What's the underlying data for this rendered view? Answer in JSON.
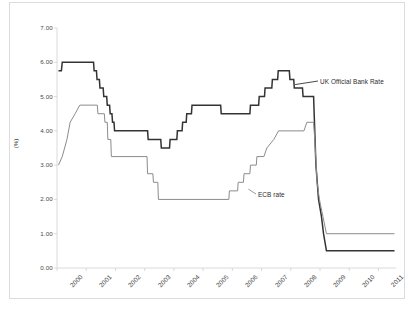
{
  "chart_data": {
    "type": "line",
    "title": "",
    "subtitle": "",
    "xlabel": "",
    "ylabel": "(%)",
    "xlim": [
      2000,
      2011.6
    ],
    "ylim": [
      0.0,
      7.0
    ],
    "ytick_step": 1.0,
    "grid": false,
    "legend_position": "inline-annotations",
    "categories": [
      "2000",
      "2001",
      "2002",
      "2003",
      "2004",
      "2005",
      "2006",
      "2007",
      "2008",
      "2009",
      "2010",
      "2011"
    ],
    "xtick_labels": [
      "2000",
      "2001",
      "2002",
      "2003",
      "2004",
      "2005",
      "2006",
      "2007",
      "2008",
      "2009",
      "2010",
      "2011"
    ],
    "ytick_labels": [
      "0.00",
      "1.00",
      "2.00",
      "3.00",
      "4.00",
      "5.00",
      "6.00",
      "7.00"
    ],
    "series": [
      {
        "name": "UK Official Bank Rate",
        "color": "#333333",
        "annotation_label": "UK Official Bank Rate",
        "points": [
          [
            2000.05,
            5.75
          ],
          [
            2000.15,
            5.75
          ],
          [
            2000.18,
            6.0
          ],
          [
            2001.25,
            6.0
          ],
          [
            2001.27,
            5.75
          ],
          [
            2001.35,
            5.75
          ],
          [
            2001.37,
            5.5
          ],
          [
            2001.45,
            5.5
          ],
          [
            2001.47,
            5.25
          ],
          [
            2001.58,
            5.25
          ],
          [
            2001.6,
            5.0
          ],
          [
            2001.7,
            5.0
          ],
          [
            2001.72,
            4.75
          ],
          [
            2001.8,
            4.75
          ],
          [
            2001.82,
            4.5
          ],
          [
            2001.88,
            4.5
          ],
          [
            2001.9,
            4.25
          ],
          [
            2001.95,
            4.25
          ],
          [
            2001.97,
            4.0
          ],
          [
            2003.1,
            4.0
          ],
          [
            2003.12,
            3.75
          ],
          [
            2003.55,
            3.75
          ],
          [
            2003.57,
            3.5
          ],
          [
            2003.85,
            3.5
          ],
          [
            2003.87,
            3.75
          ],
          [
            2004.1,
            3.75
          ],
          [
            2004.12,
            4.0
          ],
          [
            2004.28,
            4.0
          ],
          [
            2004.3,
            4.25
          ],
          [
            2004.42,
            4.25
          ],
          [
            2004.44,
            4.5
          ],
          [
            2004.6,
            4.5
          ],
          [
            2004.62,
            4.75
          ],
          [
            2005.6,
            4.75
          ],
          [
            2005.62,
            4.5
          ],
          [
            2006.6,
            4.5
          ],
          [
            2006.62,
            4.75
          ],
          [
            2006.9,
            4.75
          ],
          [
            2006.92,
            5.0
          ],
          [
            2007.1,
            5.0
          ],
          [
            2007.12,
            5.25
          ],
          [
            2007.35,
            5.25
          ],
          [
            2007.37,
            5.5
          ],
          [
            2007.55,
            5.5
          ],
          [
            2007.57,
            5.75
          ],
          [
            2007.95,
            5.75
          ],
          [
            2007.97,
            5.5
          ],
          [
            2008.1,
            5.5
          ],
          [
            2008.12,
            5.25
          ],
          [
            2008.4,
            5.25
          ],
          [
            2008.42,
            5.0
          ],
          [
            2008.78,
            5.0
          ],
          [
            2008.8,
            4.5
          ],
          [
            2008.86,
            3.0
          ],
          [
            2008.95,
            2.0
          ],
          [
            2009.05,
            1.5
          ],
          [
            2009.12,
            1.0
          ],
          [
            2009.22,
            0.5
          ],
          [
            2011.55,
            0.5
          ]
        ]
      },
      {
        "name": "ECB rate",
        "color": "#8c8c8c",
        "annotation_label": "ECB rate",
        "points": [
          [
            2000.05,
            3.0
          ],
          [
            2000.18,
            3.25
          ],
          [
            2000.26,
            3.5
          ],
          [
            2000.34,
            3.75
          ],
          [
            2000.45,
            4.25
          ],
          [
            2000.62,
            4.5
          ],
          [
            2000.78,
            4.75
          ],
          [
            2001.38,
            4.75
          ],
          [
            2001.4,
            4.5
          ],
          [
            2001.62,
            4.5
          ],
          [
            2001.64,
            4.25
          ],
          [
            2001.72,
            4.25
          ],
          [
            2001.74,
            3.75
          ],
          [
            2001.84,
            3.75
          ],
          [
            2001.86,
            3.25
          ],
          [
            2003.08,
            3.25
          ],
          [
            2003.1,
            2.75
          ],
          [
            2003.28,
            2.75
          ],
          [
            2003.3,
            2.5
          ],
          [
            2003.45,
            2.5
          ],
          [
            2003.47,
            2.0
          ],
          [
            2005.88,
            2.0
          ],
          [
            2005.9,
            2.25
          ],
          [
            2006.18,
            2.25
          ],
          [
            2006.2,
            2.5
          ],
          [
            2006.38,
            2.5
          ],
          [
            2006.4,
            2.75
          ],
          [
            2006.6,
            2.75
          ],
          [
            2006.62,
            3.0
          ],
          [
            2006.82,
            3.0
          ],
          [
            2006.84,
            3.25
          ],
          [
            2007.08,
            3.25
          ],
          [
            2007.18,
            3.5
          ],
          [
            2007.42,
            3.75
          ],
          [
            2007.58,
            4.0
          ],
          [
            2008.45,
            4.0
          ],
          [
            2008.55,
            4.25
          ],
          [
            2008.78,
            4.25
          ],
          [
            2008.82,
            3.75
          ],
          [
            2008.9,
            2.5
          ],
          [
            2008.98,
            2.0
          ],
          [
            2009.1,
            1.5
          ],
          [
            2009.22,
            1.0
          ],
          [
            2011.55,
            1.0
          ]
        ]
      }
    ],
    "annotations": [
      {
        "text": "UK Official Bank Rate",
        "attach_x": 2008.15,
        "attach_y": 5.35
      },
      {
        "text": "ECB rate",
        "attach_x": 2006.55,
        "attach_y": 2.3
      }
    ]
  }
}
